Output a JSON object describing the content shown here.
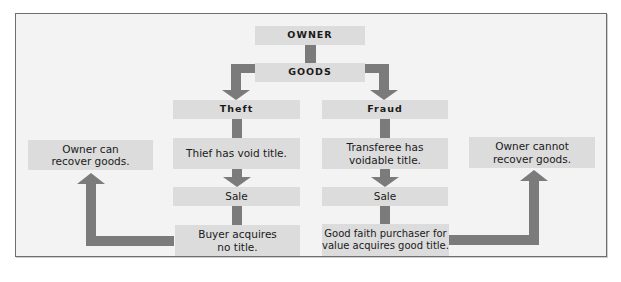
{
  "diagram": {
    "top": {
      "owner": "OWNER",
      "goods": "GOODS"
    },
    "left_branch": {
      "header": "Theft",
      "step1": "Thief has void title.",
      "step2": "Sale",
      "result": "Buyer acquires\nno title.",
      "outcome": "Owner can\nrecover goods."
    },
    "right_branch": {
      "header": "Fraud",
      "step1": "Transferee has\nvoidable title.",
      "step2": "Sale",
      "result": "Good faith purchaser for\nvalue acquires good title.",
      "outcome": "Owner cannot\nrecover goods."
    },
    "colors": {
      "box_fill": "#dcdcdc",
      "arrow": "#7b7b7b",
      "background": "#f3f3f3",
      "border": "#6e6e6e"
    }
  }
}
